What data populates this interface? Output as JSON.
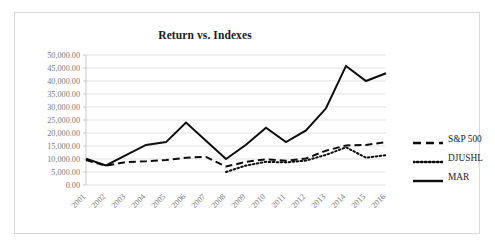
{
  "chart_data": {
    "type": "line",
    "title": "Return vs. Indexes",
    "xlabel": "",
    "ylabel": "",
    "grid": true,
    "legend_position": "right",
    "categories": [
      "2001",
      "2002",
      "2003",
      "2004",
      "2005",
      "2006",
      "2007",
      "2008",
      "2009",
      "2010",
      "2011",
      "2012",
      "2013",
      "2014",
      "2015",
      "2016"
    ],
    "ylim": [
      0,
      50000
    ],
    "ytick_step": 5000,
    "ytick_labels": [
      "50,000.00",
      "45,000.00",
      "40,000.00",
      "35,000.00",
      "30,000.00",
      "25,000.00",
      "20,000.00",
      "15,000.00",
      "10,000.00",
      "5,000.00",
      "0.00"
    ],
    "series": [
      {
        "name": "S&P 500",
        "style": "dashed",
        "color": "#0d0d0d",
        "values": [
          9600,
          7400,
          8800,
          9100,
          9600,
          10500,
          10800,
          7100,
          8900,
          9900,
          9300,
          10200,
          13200,
          15200,
          15400,
          16500
        ]
      },
      {
        "name": "DJUSHL",
        "style": "dotted",
        "color": "#0d0d0d",
        "values": [
          null,
          null,
          null,
          null,
          null,
          null,
          null,
          5000,
          7500,
          8900,
          8700,
          9400,
          11600,
          14500,
          10500,
          11500
        ]
      },
      {
        "name": "MAR",
        "style": "solid",
        "color": "#0d0d0d",
        "values": [
          10100,
          7500,
          11500,
          15400,
          16500,
          24000,
          17000,
          10000,
          15500,
          22000,
          16500,
          21000,
          29500,
          45800,
          40000,
          43000
        ]
      }
    ]
  },
  "legend": {
    "items": [
      {
        "label": "S&P 500",
        "style": "dashed"
      },
      {
        "label": "DJUSHL",
        "style": "dotted"
      },
      {
        "label": "MAR",
        "style": "solid"
      }
    ]
  }
}
